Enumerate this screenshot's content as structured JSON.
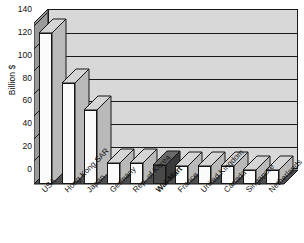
{
  "chart_data": {
    "type": "bar",
    "title": "",
    "xlabel": "",
    "ylabel": "Billion $",
    "ylim": [
      0,
      140
    ],
    "yticks": [
      0,
      20,
      40,
      60,
      80,
      100,
      120,
      140
    ],
    "grid": true,
    "legend": "none",
    "style": "3d-column",
    "highlight_category": "Wal-Mart",
    "highlight_color": "#4a4a4a",
    "bar_color": "#fbfbfb",
    "backwall_color": "#d8d8d8",
    "floor_color": "#4f4f4f",
    "outline_color": "#161616",
    "categories": [
      "USA",
      "Hong Kong SAR",
      "Japan",
      "Germany",
      "Rep. of Korea",
      "Wal-Mart",
      "France",
      "United Kingdom",
      "Canada",
      "Singapore",
      "Netherlands"
    ],
    "values": [
      132,
      88,
      65,
      18,
      18,
      17,
      16,
      16,
      16,
      12,
      12
    ]
  },
  "axis": {
    "y_title": "Billion $",
    "tick_labels": [
      "140",
      "120",
      "100",
      "80",
      "60",
      "40",
      "20",
      "0"
    ]
  }
}
